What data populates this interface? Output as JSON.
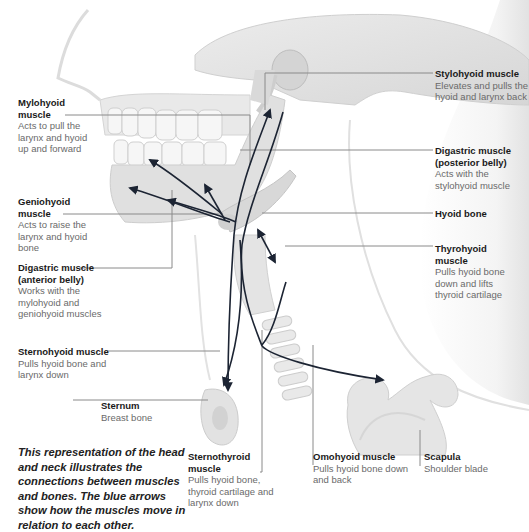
{
  "colors": {
    "arrow": "#1c2433",
    "leader_line": "#8a8a8a",
    "bone_fill": "#e6e6e6",
    "bone_shade": "#cfcfcf",
    "skin_outline": "#d8d8d8",
    "title_text": "#1a1a1a",
    "desc_text": "#6a6a6a"
  },
  "labels": {
    "mylohyoid": {
      "title": "Mylohyoid muscle",
      "desc": "Acts to pull the larynx and hyoid up and forward"
    },
    "geniohyoid": {
      "title": "Geniohyoid muscle",
      "desc": "Acts to raise the larynx and hyoid bone"
    },
    "digastric_anterior": {
      "title": "Digastric muscle (anterior belly)",
      "desc": "Works with the mylohyoid and geniohyoid muscles"
    },
    "sternohyoid": {
      "title": "Sternohyoid muscle",
      "desc": "Pulls hyoid bone and larynx down"
    },
    "sternum": {
      "title": "Sternum",
      "desc": "Breast bone"
    },
    "stylohyoid": {
      "title": "Stylohyoid muscle",
      "desc": "Elevates and pulls the hyoid and larynx back"
    },
    "digastric_posterior": {
      "title": "Digastric muscle (posterior belly)",
      "desc": "Acts with the stylohyoid muscle"
    },
    "hyoid_bone": {
      "title": "Hyoid bone",
      "desc": ""
    },
    "thyrohyoid": {
      "title": "Thyrohyoid muscle",
      "desc": "Pulls hyoid bone down and lifts thyroid cartilage"
    },
    "sternothyroid": {
      "title": "Sternothyroid muscle",
      "desc": "Pulls hyoid bone, thyroid cartilage and larynx down"
    },
    "omohyoid": {
      "title": "Omohyoid muscle",
      "desc": "Pulls hyoid bone down and back"
    },
    "scapula": {
      "title": "Scapula",
      "desc": "Shoulder blade"
    }
  },
  "caption": "This representation of the head and neck illustrates the connections between muscles and bones. The blue arrows show how the muscles move in relation to each other."
}
